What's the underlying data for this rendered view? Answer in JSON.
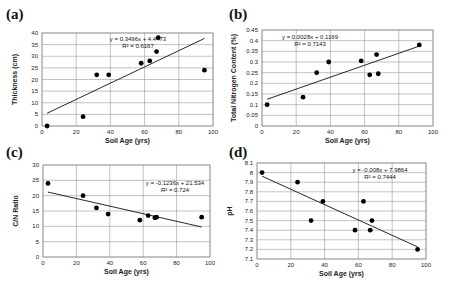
{
  "chart_data": [
    {
      "panel": "(a)",
      "type": "scatter",
      "xlabel": "Soil Age (yrs)",
      "ylabel": "Thickness (cm)",
      "xlim": [
        0,
        100
      ],
      "ylim": [
        0,
        40
      ],
      "xticks": [
        0,
        20,
        40,
        60,
        80,
        100
      ],
      "yticks": [
        0,
        5,
        10,
        15,
        20,
        25,
        30,
        35,
        40
      ],
      "grid": true,
      "points": [
        [
          3,
          0
        ],
        [
          24,
          4
        ],
        [
          32,
          22
        ],
        [
          39,
          22
        ],
        [
          58,
          27
        ],
        [
          63,
          28
        ],
        [
          67,
          32
        ],
        [
          68,
          38
        ],
        [
          95,
          24
        ]
      ],
      "trendline": {
        "slope": 0.3496,
        "intercept": 4.4473,
        "x_range": [
          3,
          95
        ]
      },
      "equation": "y = 0.3496x + 4.4473",
      "r2": "R² = 0.6167"
    },
    {
      "panel": "(b)",
      "type": "scatter",
      "xlabel": "Soil Age (yrs)",
      "ylabel": "Total Nitrogen Content (%)",
      "xlim": [
        0,
        100
      ],
      "ylim": [
        0,
        0.45
      ],
      "xticks": [
        0,
        20,
        40,
        60,
        80,
        100
      ],
      "yticks": [
        0,
        0.05,
        0.1,
        0.15,
        0.2,
        0.25,
        0.3,
        0.35,
        0.4,
        0.45
      ],
      "grid": true,
      "points": [
        [
          3,
          0.1
        ],
        [
          24,
          0.135
        ],
        [
          32,
          0.25
        ],
        [
          39,
          0.3
        ],
        [
          58,
          0.305
        ],
        [
          63,
          0.24
        ],
        [
          67,
          0.335
        ],
        [
          68,
          0.245
        ],
        [
          92,
          0.38
        ]
      ],
      "trendline": {
        "slope": 0.0028,
        "intercept": 0.1169,
        "x_range": [
          3,
          92
        ]
      },
      "equation": "y = 0.0028x + 0.1169",
      "r2": "R² = 0.7143"
    },
    {
      "panel": "(c)",
      "type": "scatter",
      "xlabel": "Soil Age (yrs)",
      "ylabel": "C/N Ratio",
      "xlim": [
        0,
        100
      ],
      "ylim": [
        0,
        30
      ],
      "xticks": [
        0,
        20,
        40,
        60,
        80,
        100
      ],
      "yticks": [
        0,
        5,
        10,
        15,
        20,
        25,
        30
      ],
      "grid": true,
      "points": [
        [
          3,
          24
        ],
        [
          24,
          20
        ],
        [
          32,
          16
        ],
        [
          39,
          14
        ],
        [
          58,
          12
        ],
        [
          63,
          13.5
        ],
        [
          67,
          12.8
        ],
        [
          68,
          13
        ],
        [
          95,
          13
        ]
      ],
      "trendline": {
        "slope": -0.1236,
        "intercept": 21.534,
        "x_range": [
          3,
          95
        ]
      },
      "equation": "y = -0.1236x + 21.534",
      "r2": "R² = 0.724"
    },
    {
      "panel": "(d)",
      "type": "scatter",
      "xlabel": "Soil Age (yrs)",
      "ylabel": "pH",
      "xlim": [
        0,
        100
      ],
      "ylim": [
        7.1,
        8.1
      ],
      "xticks": [
        0,
        20,
        40,
        60,
        80,
        100
      ],
      "yticks": [
        7.1,
        7.2,
        7.3,
        7.4,
        7.5,
        7.6,
        7.7,
        7.8,
        7.9,
        8,
        8.1
      ],
      "grid": true,
      "points": [
        [
          3,
          8.0
        ],
        [
          24,
          7.9
        ],
        [
          32,
          7.5
        ],
        [
          39,
          7.7
        ],
        [
          58,
          7.4
        ],
        [
          63,
          7.7
        ],
        [
          67,
          7.4
        ],
        [
          68,
          7.5
        ],
        [
          95,
          7.2
        ]
      ],
      "trendline": {
        "slope": -0.008,
        "intercept": 7.9864,
        "x_range": [
          3,
          95
        ]
      },
      "equation": "y = -0.008x + 7.9864",
      "r2": "R² = 0.7444"
    }
  ],
  "panels": [
    {
      "label": "(a)"
    },
    {
      "label": "(b)"
    },
    {
      "label": "(c)"
    },
    {
      "label": "(d)"
    }
  ]
}
